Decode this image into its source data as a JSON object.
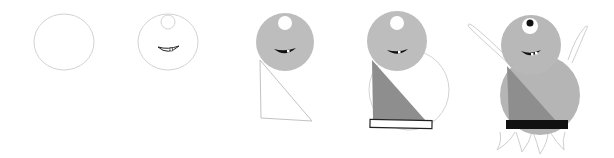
{
  "diagram": {
    "type": "step-by-step drawing tutorial",
    "step_count": 5,
    "steps": [
      {
        "index": 1,
        "description": "Draw a circle for the head"
      },
      {
        "index": 2,
        "description": "Add a small circle for the eye and a grinning mouth with teeth"
      },
      {
        "index": 3,
        "description": "Shade the head grey and draw a triangle for the body"
      },
      {
        "index": 4,
        "description": "Add a large round body, shade the triangle darker, add a belt"
      },
      {
        "index": 5,
        "description": "Add raised arms, pupil, fill body grey, black belt and pointed feet"
      }
    ]
  },
  "colors": {
    "outline": "#cfcfcf",
    "ink": "#111111",
    "head_fill": "#bdbdbd",
    "body_fill": "#b5b5b5",
    "shade_fill": "#8e8e8e",
    "eye_white": "#ffffff",
    "belt_final": "#111111"
  }
}
